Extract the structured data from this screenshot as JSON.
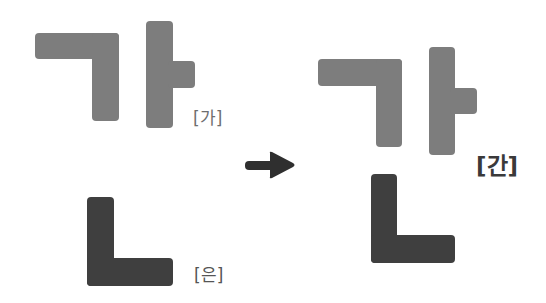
{
  "diagram": {
    "type": "korean-syllable-composition",
    "colors": {
      "light_component": "#7d7d7d",
      "dark_component": "#3f3f3f",
      "background": "#ffffff",
      "arrow": "#2f2f2f"
    },
    "inputs": [
      {
        "id": "ga",
        "components": [
          "ㄱ",
          "ㅏ"
        ],
        "label": "[가]",
        "shade": "light"
      },
      {
        "id": "eun",
        "components": [
          "ㄴ"
        ],
        "label": "[은]",
        "shade": "dark"
      }
    ],
    "arrow": {
      "direction": "right",
      "icon": "arrow-right-icon"
    },
    "result": {
      "id": "gan",
      "components": [
        "ㄱ",
        "ㅏ",
        "ㄴ"
      ],
      "label": "[간]"
    }
  }
}
